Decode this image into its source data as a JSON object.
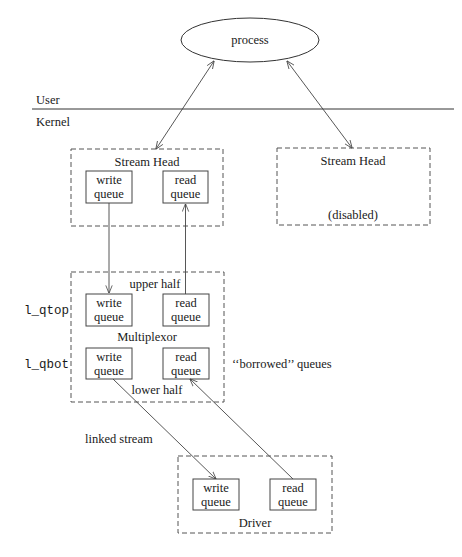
{
  "diagram": {
    "process": {
      "label": "process"
    },
    "boundary": {
      "user_label": "User",
      "kernel_label": "Kernel"
    },
    "stream_head_left": {
      "title": "Stream Head",
      "write_queue": {
        "line1": "write",
        "line2": "queue"
      },
      "read_queue": {
        "line1": "read",
        "line2": "queue"
      }
    },
    "stream_head_right": {
      "title": "Stream Head",
      "status": "(disabled)"
    },
    "multiplexor": {
      "title": "Multiplexor",
      "upper_label": "upper half",
      "lower_label": "lower half",
      "top_pointer": "l_qtop",
      "bottom_pointer": "l_qbot",
      "upper_write_queue": {
        "line1": "write",
        "line2": "queue"
      },
      "upper_read_queue": {
        "line1": "read",
        "line2": "queue"
      },
      "lower_write_queue": {
        "line1": "write",
        "line2": "queue"
      },
      "lower_read_queue": {
        "line1": "read",
        "line2": "queue"
      },
      "borrowed_note": "‘‘borrowed’’ queues"
    },
    "link": {
      "label": "linked stream"
    },
    "driver": {
      "title": "Driver",
      "write_queue": {
        "line1": "write",
        "line2": "queue"
      },
      "read_queue": {
        "line1": "read",
        "line2": "queue"
      }
    }
  }
}
